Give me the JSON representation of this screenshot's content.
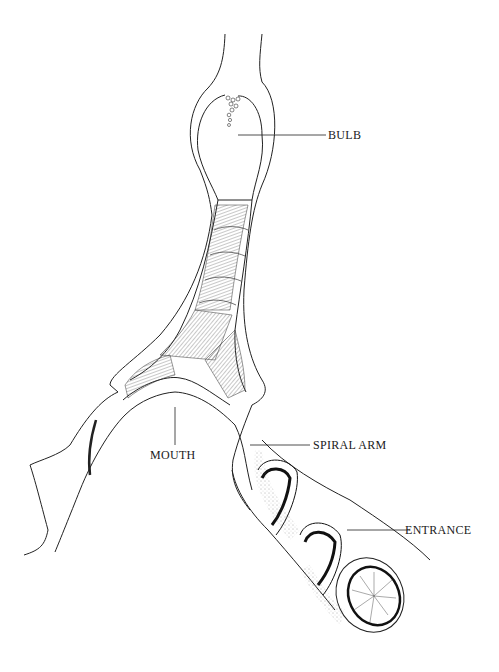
{
  "figure": {
    "type": "anatomical line drawing",
    "labels": {
      "bulb": "BULB",
      "mouth": "MOUTH",
      "spiral_arm": "SPIRAL ARM",
      "entrance": "ENTRANCE"
    }
  }
}
